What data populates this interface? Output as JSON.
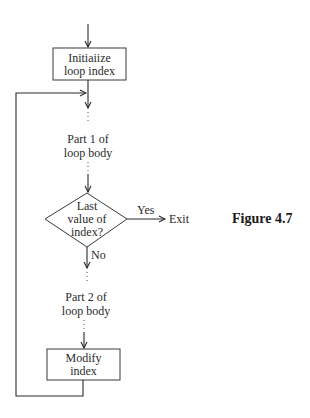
{
  "figure": {
    "caption": "Figure 4.7"
  },
  "nodes": {
    "init": {
      "line1": "Initiaiize",
      "line2": "loop index"
    },
    "part1": {
      "line1": "Part 1 of",
      "line2": "loop body"
    },
    "decision": {
      "line1": "Last",
      "line2": "value of",
      "line3": "index?"
    },
    "part2": {
      "line1": "Part 2 of",
      "line2": "loop body"
    },
    "modify": {
      "line1": "Modify",
      "line2": "index"
    },
    "exit": {
      "label": "Exit"
    }
  },
  "edges": {
    "yes": "Yes",
    "no": "No"
  },
  "colors": {
    "ink": "#2a2a2a",
    "background": "#ffffff"
  }
}
